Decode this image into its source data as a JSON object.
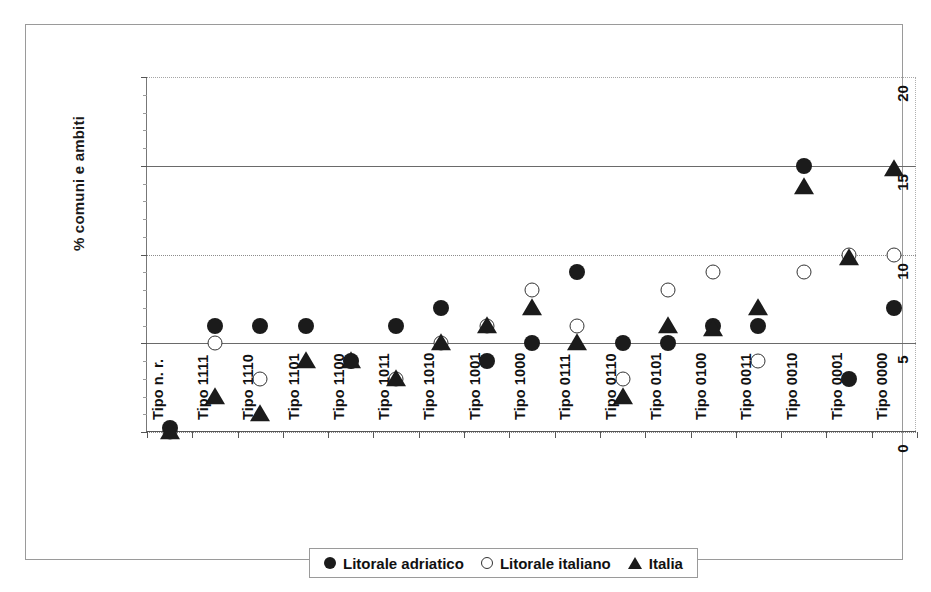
{
  "chart_data": {
    "type": "scatter",
    "title": "",
    "xlabel": "",
    "ylabel": "% comuni e ambiti",
    "ylim": [
      0,
      20
    ],
    "yticks": [
      "0",
      "5",
      "10",
      "15",
      "20"
    ],
    "ytick_values": [
      0,
      5,
      10,
      15,
      20
    ],
    "y_minor_step": 1,
    "grid": true,
    "legend_position": "bottom",
    "categories": [
      "Tipo n. r.",
      "Tipo 1111",
      "Tipo 1110",
      "Tipo 1101",
      "Tipo 1100",
      "Tipo 1011",
      "Tipo 1010",
      "Tipo 1001",
      "Tipo 1000",
      "Tipo 0111",
      "Tipo 0110",
      "Tipo 0101",
      "Tipo 0100",
      "Tipo 0011",
      "Tipo 0010",
      "Tipo 0001",
      "Tipo 0000"
    ],
    "series": [
      {
        "name": "Litorale adriatico",
        "marker": "filled-circle",
        "color": "#1b1b1b",
        "values": [
          0.2,
          6,
          6,
          6,
          4,
          6,
          7,
          4,
          5,
          9,
          5,
          5,
          6,
          6,
          15,
          3,
          7
        ]
      },
      {
        "name": "Litorale italiano",
        "marker": "open-circle",
        "color": "#333333",
        "values": [
          0,
          5,
          3,
          null,
          4,
          3,
          5,
          6,
          8,
          6,
          3,
          8,
          9,
          4,
          9,
          10,
          10
        ]
      },
      {
        "name": "Italia",
        "marker": "filled-triangle",
        "color": "#1b1b1b",
        "values": [
          0,
          2,
          1,
          4,
          4,
          3,
          5,
          6,
          7,
          5,
          2,
          6,
          5.8,
          7,
          13.8,
          9.8,
          14.8
        ]
      }
    ]
  },
  "legend": {
    "entries": [
      {
        "label": "Litorale adriatico",
        "marker": "filled-circle"
      },
      {
        "label": "Litorale italiano",
        "marker": "open-circle"
      },
      {
        "label": "Italia",
        "marker": "filled-triangle"
      }
    ]
  },
  "colors": {
    "marker_fill": "#1b1b1b",
    "marker_stroke": "#333333",
    "grid": "#8c8c8c",
    "axis": "#555555",
    "frame": "#9a9a9a",
    "background": "#ffffff"
  }
}
